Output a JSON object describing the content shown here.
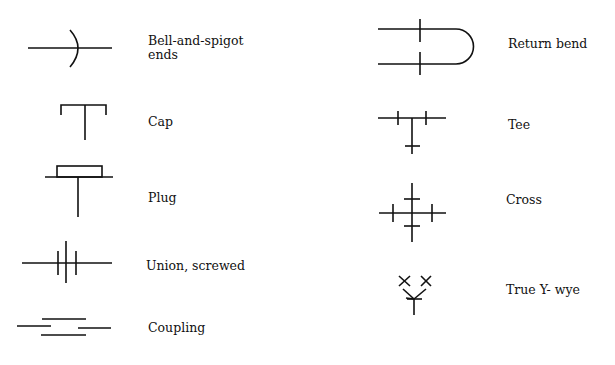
{
  "left_column": [
    {
      "label_line1": "Bell-and-spigot",
      "label_line2": "ends",
      "symbol": "bell-and-spigot-icon"
    },
    {
      "label_line1": "Cap",
      "symbol": "cap-icon"
    },
    {
      "label_line1": "Plug",
      "symbol": "plug-icon"
    },
    {
      "label_line1": "Union, screwed",
      "symbol": "union-screwed-icon"
    },
    {
      "label_line1": "Coupling",
      "symbol": "coupling-icon"
    }
  ],
  "right_column": [
    {
      "label_line1": "Return bend",
      "symbol": "return-bend-icon"
    },
    {
      "label_line1": "Tee",
      "symbol": "tee-icon"
    },
    {
      "label_line1": "Cross",
      "symbol": "cross-icon"
    },
    {
      "label_line1": "True Y- wye",
      "symbol": "true-y-wye-icon"
    }
  ]
}
